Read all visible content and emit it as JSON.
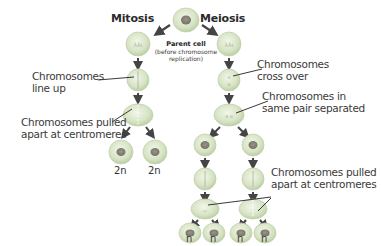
{
  "titles": {
    "mitosis": "Mitosis",
    "meiosis": "Meiosis"
  },
  "parent_cell": {
    "label": "Parent cell",
    "note_line1": "(before chromosome",
    "note_line2": "replication)"
  },
  "mitosis_labels": {
    "line_up_1": "Chromosomes",
    "line_up_2": "line up",
    "pulled_1": "Chromosomes pulled",
    "pulled_2": "apart at centromeres"
  },
  "meiosis_labels": {
    "cross_1": "Chromosomes",
    "cross_2": "cross over",
    "separated_1": "Chromosomes in",
    "separated_2": "same pair separated",
    "pulled_1": "Chromosomes pulled",
    "pulled_2": "apart at centromeres"
  },
  "ploidy": {
    "mitosis": [
      "2n",
      "2n"
    ],
    "meiosis": [
      "n",
      "n",
      "n",
      "n"
    ]
  },
  "colors": {
    "cell_fill": "#d9e6c7",
    "cell_edge": "#b9c9a4",
    "nucleus": "#8a8f7a",
    "arrow": "#4a4a4a",
    "text": "#3a3a3a"
  }
}
